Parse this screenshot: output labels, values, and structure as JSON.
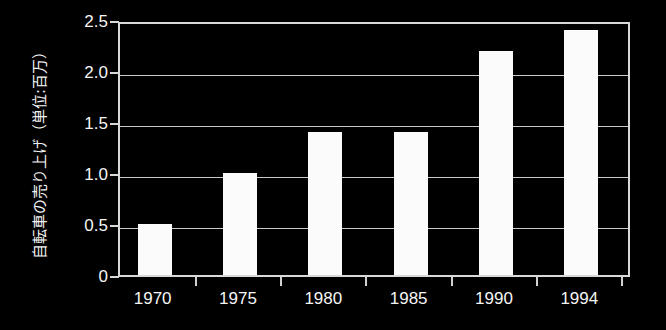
{
  "chart_data": {
    "type": "bar",
    "title": "",
    "subtitle": "",
    "xlabel": "",
    "ylabel": "自転車の売り上げ（単位:百万）",
    "categories": [
      "1970",
      "1975",
      "1980",
      "1985",
      "1990",
      "1994"
    ],
    "values": [
      0.5,
      1.0,
      1.4,
      1.4,
      2.2,
      2.4
    ],
    "series": [
      {
        "name": "自転車の売り上げ",
        "values": [
          0.5,
          1.0,
          1.4,
          1.4,
          2.2,
          2.4
        ]
      }
    ],
    "ylim": [
      0,
      2.5
    ],
    "ytick_labels": [
      "0",
      "0.5",
      "1.0",
      "1.5",
      "2.0",
      "2.5"
    ],
    "ytick_values": [
      0,
      0.5,
      1.0,
      1.5,
      2.0,
      2.5
    ],
    "xtick_labels": [
      "1970",
      "1975",
      "1980",
      "1985",
      "1990",
      "1994"
    ],
    "grid": true,
    "grid_axis": "y",
    "legend": false,
    "legend_position": "none",
    "background_color": "#000000",
    "bar_color": "#fbfbfb",
    "grid_color": "#c9c9c9",
    "axis_color": "#d9d9d9",
    "text_color": "#f5f5f5"
  }
}
